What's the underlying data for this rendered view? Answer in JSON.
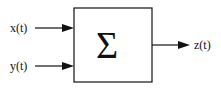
{
  "diagram": {
    "block": {
      "symbol": "Σ",
      "name": "summation block"
    },
    "inputs": [
      {
        "label": "x(t)"
      },
      {
        "label": "y(t)"
      }
    ],
    "output": {
      "label": "z(t)"
    },
    "colors": {
      "stroke": "#111111",
      "background": "#ffffff"
    }
  }
}
